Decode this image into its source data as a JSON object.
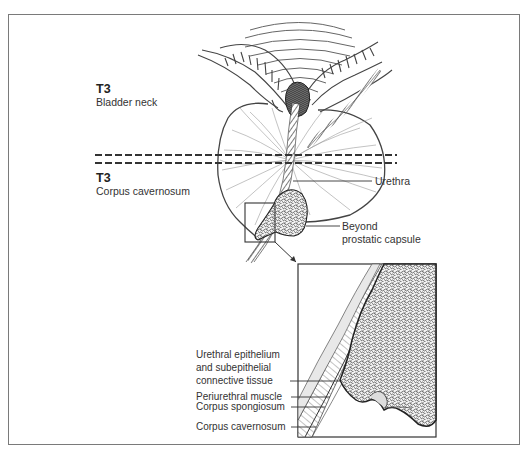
{
  "figure": {
    "stages": [
      {
        "stage": "T3",
        "description": "Bladder neck"
      },
      {
        "stage": "T3",
        "description": "Corpus cavernosum"
      }
    ],
    "main_labels": {
      "urethra": "Urethra",
      "beyond_capsule_line1": "Beyond",
      "beyond_capsule_line2": "prostatic capsule"
    },
    "inset_labels": {
      "epithelium_line1": "Urethral epithelium",
      "epithelium_line2": "and subepithelial",
      "epithelium_line3": "connective tissue",
      "periurethral_muscle": "Periurethral muscle",
      "corpus_spongiosum": "Corpus spongiosum",
      "corpus_cavernosum": "Corpus cavernosum"
    },
    "colors": {
      "frame": "#7a7a7a",
      "ink": "#2a2a2a",
      "tumor": "#3a3a3a",
      "dashed_line": "#333333"
    }
  }
}
